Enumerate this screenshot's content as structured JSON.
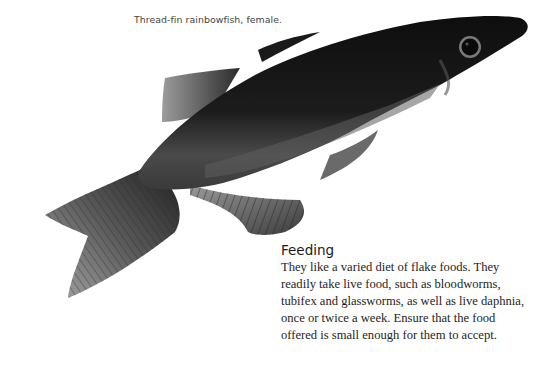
{
  "caption": "Thread-fin rainbowfish, female.",
  "image": {
    "subject": "fish-photo",
    "colors": {
      "body": "#141414",
      "fin": "#7a7a7a",
      "belly": "#5a5a5a"
    }
  },
  "section": {
    "heading": "Feeding",
    "lines": [
      "They like a varied diet of flake foods. They",
      "readily take live food, such as bloodworms,",
      "tubifex and glassworms, as well as live daphnia,",
      "once or twice a week. Ensure that the food",
      "offered is small enough for them to accept."
    ]
  }
}
